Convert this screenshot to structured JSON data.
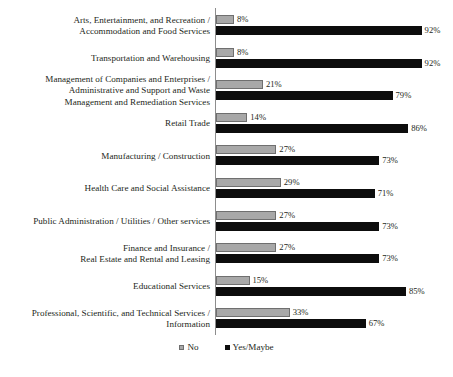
{
  "chart_data": {
    "type": "bar",
    "title": "",
    "subtitle": "",
    "xlabel": "",
    "ylabel": "",
    "orientation": "horizontal",
    "grid": false,
    "xlim": [
      0,
      100
    ],
    "value_suffix": "%",
    "legend_position": "bottom",
    "categories": [
      "Arts, Entertainment, and Recreation /\nAccommodation and Food Services",
      "Transportation and Warehousing",
      "Management of Companies and Enterprises /\nAdministrative and Support and Waste\nManagement and Remediation Services",
      "Retail Trade",
      "Manufacturing / Construction",
      "Health Care and Social Assistance",
      "Public Administration / Utilities / Other services",
      "Finance and Insurance /\nReal Estate and Rental and Leasing",
      "Educational Services",
      "Professional, Scientific, and Technical Services /\nInformation"
    ],
    "series": [
      {
        "name": "No",
        "color": "#a8a8a8",
        "values": [
          8,
          8,
          21,
          14,
          27,
          29,
          27,
          27,
          15,
          33
        ],
        "labels": [
          "8%",
          "8%",
          "21%",
          "14%",
          "27%",
          "29%",
          "27%",
          "27%",
          "15%",
          "33%"
        ]
      },
      {
        "name": "Yes/Maybe",
        "color": "#0d0d0d",
        "values": [
          92,
          92,
          79,
          86,
          73,
          71,
          73,
          73,
          85,
          67
        ],
        "labels": [
          "92%",
          "92%",
          "79%",
          "86%",
          "73%",
          "71%",
          "73%",
          "73%",
          "85%",
          "67%"
        ]
      }
    ]
  },
  "legend": {
    "items": [
      {
        "label": "No",
        "color": "#a8a8a8"
      },
      {
        "label": "Yes/Maybe",
        "color": "#0d0d0d"
      }
    ]
  },
  "colors": {
    "no": "#a8a8a8",
    "yes_maybe": "#0d0d0d",
    "axis": "#8d8d8d",
    "text": "#231f20",
    "background": "#ffffff"
  }
}
